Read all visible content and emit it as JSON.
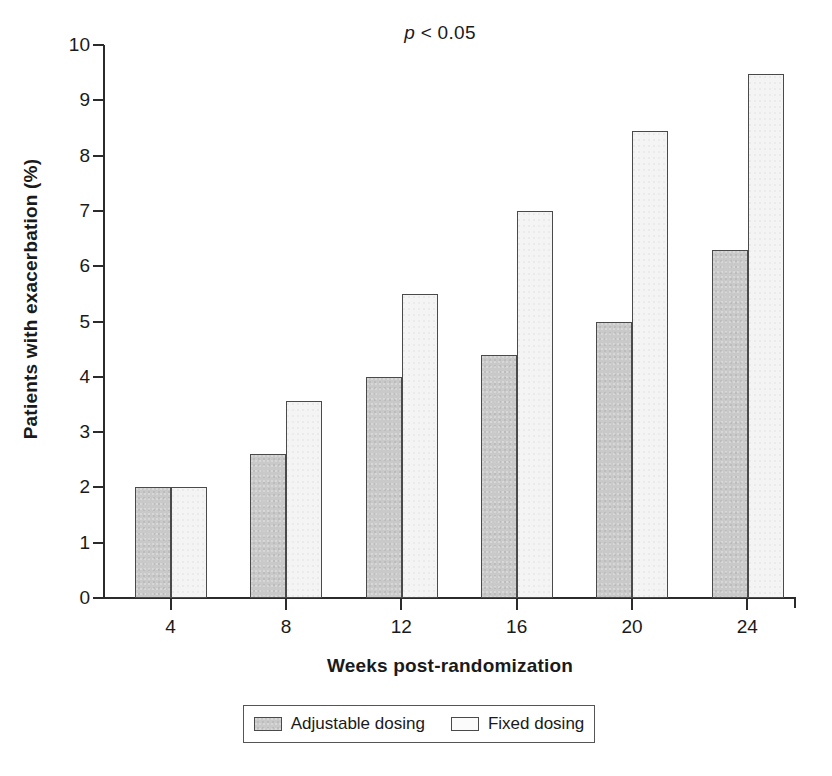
{
  "annotation": {
    "pvalue_prefix": "p",
    "pvalue_rest": " < 0.05"
  },
  "axes": {
    "ylabel": "Patients with exacerbation (%)",
    "xlabel": "Weeks post-randomization",
    "yticks": [
      "10",
      "9",
      "8",
      "7",
      "6",
      "5",
      "4",
      "3",
      "2",
      "1",
      "0"
    ],
    "xticks": [
      "4",
      "8",
      "12",
      "16",
      "20",
      "24"
    ]
  },
  "legend": {
    "entries": [
      {
        "label": "Adjustable dosing",
        "swatch": "gray-stipple-swatch",
        "color": "#c9c9c9"
      },
      {
        "label": "Fixed dosing",
        "swatch": "white-swatch",
        "color": "#ffffff"
      }
    ]
  },
  "chart_data": {
    "type": "bar",
    "title": "",
    "annotation": "p < 0.05",
    "xlabel": "Weeks post-randomization",
    "ylabel": "Patients with exacerbation (%)",
    "categories": [
      "4",
      "8",
      "12",
      "16",
      "20",
      "24"
    ],
    "xlim": [
      0,
      28
    ],
    "ylim": [
      0,
      10
    ],
    "ytick_step": 1,
    "grid": false,
    "legend_position": "bottom",
    "series": [
      {
        "name": "Adjustable dosing",
        "color": "#c9c9c9",
        "values": [
          2.0,
          2.6,
          4.0,
          4.4,
          5.0,
          6.3
        ]
      },
      {
        "name": "Fixed dosing",
        "color": "#ffffff",
        "values": [
          2.0,
          3.57,
          5.5,
          7.0,
          8.45,
          9.47
        ]
      }
    ]
  }
}
